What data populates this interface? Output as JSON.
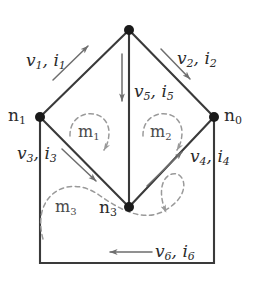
{
  "figure": {
    "kind": "circuit-graph",
    "colors": {
      "edge": "#3a3a3a",
      "node": "#1a1a1a",
      "mesh": "#8c8c8c",
      "arrow": "#6e6e6e",
      "text": "#2b2b2b",
      "background": "#ffffff"
    }
  },
  "nodes": [
    {
      "id": "nTop",
      "label": "",
      "sub": "",
      "x": 129,
      "y": 30
    },
    {
      "id": "n1",
      "label": "n",
      "sub": "1",
      "x": 40,
      "y": 117
    },
    {
      "id": "n0",
      "label": "n",
      "sub": "0",
      "x": 214,
      "y": 117
    },
    {
      "id": "n3",
      "label": "n",
      "sub": "3",
      "x": 129,
      "y": 207
    }
  ],
  "branches": [
    {
      "id": "b1",
      "v": "v",
      "i": "i",
      "sub": "1",
      "label": "v1, i1",
      "direction": "up-right",
      "from": "n1",
      "to": "nTop"
    },
    {
      "id": "b2",
      "v": "v",
      "i": "i",
      "sub": "2",
      "label": "v2, i2",
      "direction": "down-right",
      "from": "nTop",
      "to": "n0"
    },
    {
      "id": "b3",
      "v": "v",
      "i": "i",
      "sub": "3",
      "label": "v3, i3",
      "direction": "down-right",
      "from": "n1",
      "to": "n3"
    },
    {
      "id": "b4",
      "v": "v",
      "i": "i",
      "sub": "4",
      "label": "v4, i4",
      "direction": "up-right",
      "from": "n3",
      "to": "n0"
    },
    {
      "id": "b5",
      "v": "v",
      "i": "i",
      "sub": "5",
      "label": "v5, i5",
      "direction": "down",
      "from": "nTop",
      "to": "n3"
    },
    {
      "id": "b6",
      "v": "v",
      "i": "i",
      "sub": "6",
      "label": "v6, i6",
      "direction": "left",
      "from": "n0",
      "to": "n1"
    }
  ],
  "meshes": [
    {
      "id": "m1",
      "label": "m",
      "sub": "1",
      "rotation": "clockwise"
    },
    {
      "id": "m2",
      "label": "m",
      "sub": "2",
      "rotation": "clockwise"
    },
    {
      "id": "m3",
      "label": "m",
      "sub": "3",
      "rotation": "clockwise"
    }
  ]
}
